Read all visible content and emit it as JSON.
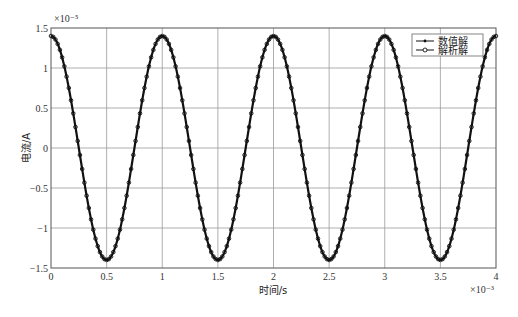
{
  "chart_data": {
    "type": "line",
    "title": "",
    "xlabel": "时间/s",
    "ylabel": "电流/A",
    "x_multiplier": "×10⁻³",
    "y_multiplier": "×10⁻⁵",
    "xlim": [
      0,
      4
    ],
    "ylim": [
      -1.5,
      1.5
    ],
    "x_ticks": [
      "0",
      "0.5",
      "1",
      "1.5",
      "2",
      "2.5",
      "3",
      "3.5",
      "4"
    ],
    "y_ticks": [
      "1.5",
      "1",
      "0.5",
      "0",
      "−0.5",
      "−1",
      "−1.5"
    ],
    "grid": true,
    "legend_position": "upper right",
    "function": "i(t) = 1.4e-5 · cos(2π·1000·t)",
    "amplitude": 1.4,
    "period": 1.0,
    "series": [
      {
        "name": "数值解",
        "marker": "dot",
        "line": "solid",
        "x": [
          0,
          0.25,
          0.5,
          0.75,
          1,
          1.25,
          1.5,
          1.75,
          2,
          2.25,
          2.5,
          2.75,
          3,
          3.25,
          3.5,
          3.75,
          4
        ],
        "values": [
          1.4,
          0,
          -1.4,
          0,
          1.4,
          0,
          -1.4,
          0,
          1.4,
          0,
          -1.4,
          0,
          1.4,
          0,
          -1.4,
          0,
          1.4
        ]
      },
      {
        "name": "解析解",
        "marker": "circle",
        "line": "solid",
        "x": [
          0,
          0.25,
          0.5,
          0.75,
          1,
          1.25,
          1.5,
          1.75,
          2,
          2.25,
          2.5,
          2.75,
          3,
          3.25,
          3.5,
          3.75,
          4
        ],
        "values": [
          1.4,
          0,
          -1.4,
          0,
          1.4,
          0,
          -1.4,
          0,
          1.4,
          0,
          -1.4,
          0,
          1.4,
          0,
          -1.4,
          0,
          1.4
        ]
      }
    ],
    "colors": {
      "curve": "#111111",
      "grid": "#9a9a9a",
      "axes": "#555555"
    }
  }
}
